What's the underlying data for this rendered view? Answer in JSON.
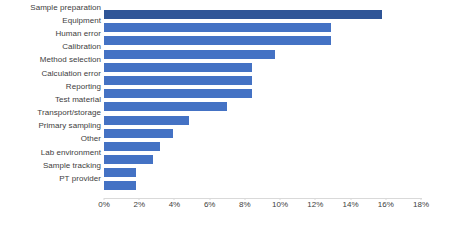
{
  "chart_data": {
    "type": "bar",
    "orientation": "horizontal",
    "title": "",
    "xlabel": "",
    "ylabel": "",
    "xlim": [
      0,
      18
    ],
    "xtick_labels": [
      "0%",
      "2%",
      "4%",
      "6%",
      "8%",
      "10%",
      "12%",
      "14%",
      "16%",
      "18%"
    ],
    "xticks": [
      0,
      2,
      4,
      6,
      8,
      10,
      12,
      14,
      16,
      18
    ],
    "grid": false,
    "legend": "none",
    "value_suffix": "%",
    "categories": [
      "Sample preparation",
      "Equipment",
      "Human error",
      "Calibration",
      "Method selection",
      "Calculation error",
      "Reporting",
      "Test material",
      "Transport/storage",
      "Primary sampling",
      "Other",
      "Lab environment",
      "Sample tracking",
      "PT provider"
    ],
    "values": [
      15.8,
      12.9,
      12.9,
      9.7,
      8.4,
      8.4,
      8.4,
      7.0,
      4.8,
      3.9,
      3.2,
      2.8,
      1.8,
      1.8
    ],
    "bar_colors": [
      "#2f5597",
      "#4472c4",
      "#4472c4",
      "#4472c4",
      "#4472c4",
      "#4472c4",
      "#4472c4",
      "#4472c4",
      "#4472c4",
      "#4472c4",
      "#4472c4",
      "#4472c4",
      "#4472c4",
      "#4472c4"
    ],
    "highlight_index": 0,
    "colors": {
      "accent": "#4472c4",
      "highlight": "#2f5597",
      "axis": "#d9d9d9",
      "text": "#404040",
      "background": "#ffffff"
    }
  }
}
